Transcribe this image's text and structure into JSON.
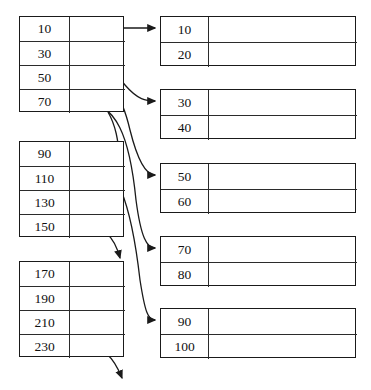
{
  "diagram": {
    "stroke_color": "#1a1a1a",
    "background_color": "#ffffff"
  },
  "index_blocks": [
    {
      "name": "index-block-1",
      "x": 19,
      "y": 16,
      "entries": [
        {
          "key": "10"
        },
        {
          "key": "30"
        },
        {
          "key": "50"
        },
        {
          "key": "70"
        }
      ]
    },
    {
      "name": "index-block-2",
      "x": 19,
      "y": 141,
      "entries": [
        {
          "key": "90"
        },
        {
          "key": "110"
        },
        {
          "key": "130"
        },
        {
          "key": "150"
        }
      ]
    },
    {
      "name": "index-block-3",
      "x": 19,
      "y": 261,
      "entries": [
        {
          "key": "170"
        },
        {
          "key": "190"
        },
        {
          "key": "210"
        },
        {
          "key": "230"
        }
      ]
    }
  ],
  "data_blocks": [
    {
      "name": "data-block-1",
      "x": 160,
      "y": 16,
      "records": [
        "10",
        "20"
      ]
    },
    {
      "name": "data-block-2",
      "x": 160,
      "y": 89,
      "records": [
        "30",
        "40"
      ]
    },
    {
      "name": "data-block-3",
      "x": 160,
      "y": 163,
      "records": [
        "50",
        "60"
      ]
    },
    {
      "name": "data-block-4",
      "x": 160,
      "y": 236,
      "records": [
        "70",
        "80"
      ]
    },
    {
      "name": "data-block-5",
      "x": 160,
      "y": 308,
      "records": [
        "90",
        "100"
      ]
    }
  ],
  "pointers": [
    {
      "name": "pointer-10-to-data-1",
      "from": "10",
      "to": "10",
      "path": "M 78 28 L 155 28",
      "arrow": true
    },
    {
      "name": "pointer-30-to-data-2",
      "from": "30",
      "to": "30",
      "path": "M 78 52 C 112 52 112 70 125 85 C 138 100 146 101 155 101",
      "arrow": true
    },
    {
      "name": "pointer-50-to-data-3",
      "from": "50",
      "to": "50",
      "path": "M 78 76 C 112 76 122 96 130 130 C 138 162 146 175 155 175",
      "arrow": true
    },
    {
      "name": "pointer-70-to-data-4",
      "from": "70",
      "to": "70",
      "path": "M 78 100 C 118 100 130 140 136 200 C 141 238 147 248 155 248",
      "arrow": true
    },
    {
      "name": "pointer-90-to-data-5",
      "from": "90",
      "to": "90",
      "path": "M 78 153 C 118 153 132 210 140 280 C 145 312 148 320 155 320",
      "arrow": true
    },
    {
      "name": "pointer-110-dangling",
      "from": "110",
      "to": null,
      "path": "M 78 177 C 104 177 114 188 120 210",
      "arrow": true
    },
    {
      "name": "pointer-130-dangling",
      "from": "130",
      "to": null,
      "path": "M 78 201 C 104 201 114 212 120 234",
      "arrow": true
    },
    {
      "name": "pointer-150-dangling",
      "from": "150",
      "to": null,
      "path": "M 78 225 C 104 225 114 236 120 258",
      "arrow": true
    },
    {
      "name": "pointer-70b-dangling",
      "from": "70",
      "to": null,
      "path": "M 108 112 C 116 126 118 140 120 160",
      "arrow": true
    },
    {
      "name": "pointer-170-dangling",
      "from": "170",
      "to": null,
      "path": "M 78 273 C 104 273 114 284 120 306",
      "arrow": true
    },
    {
      "name": "pointer-190-dangling",
      "from": "190",
      "to": null,
      "path": "M 78 297 C 104 297 114 308 120 330",
      "arrow": true
    },
    {
      "name": "pointer-210-dangling",
      "from": "210",
      "to": null,
      "path": "M 78 321 C 104 321 114 332 120 352",
      "arrow": true
    },
    {
      "name": "pointer-230-dangling",
      "from": "230",
      "to": null,
      "path": "M 78 345 C 104 345 114 358 122 378",
      "arrow": true
    }
  ]
}
